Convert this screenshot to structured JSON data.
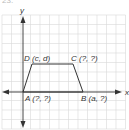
{
  "problem_number_fragment": "23.",
  "diagram": {
    "type": "coordinate-plane-trapezoid",
    "axes": {
      "x_label": "x",
      "y_label": "y"
    },
    "colors": {
      "grid": "#d9d9d9",
      "axis": "#333333",
      "shape": "#333333",
      "background": "#ffffff"
    },
    "grid": {
      "x0": 2,
      "y0": 15,
      "spacing": 9.5,
      "cols": 13,
      "rows": 12
    },
    "origin_px": {
      "x": 23,
      "y": 92
    },
    "vertices": {
      "A": {
        "label": "A (?, ?)",
        "px": [
          23,
          92
        ],
        "label_px": [
          25,
          101
        ]
      },
      "B": {
        "label": "B (a, ?)",
        "px": [
          83,
          92
        ],
        "label_px": [
          81,
          101
        ]
      },
      "C": {
        "label": "C (?, ?)",
        "px": [
          73,
          64
        ],
        "label_px": [
          71,
          61
        ]
      },
      "D": {
        "label": "D (c, d)",
        "px": [
          32,
          64
        ],
        "label_px": [
          24,
          61
        ]
      }
    }
  }
}
